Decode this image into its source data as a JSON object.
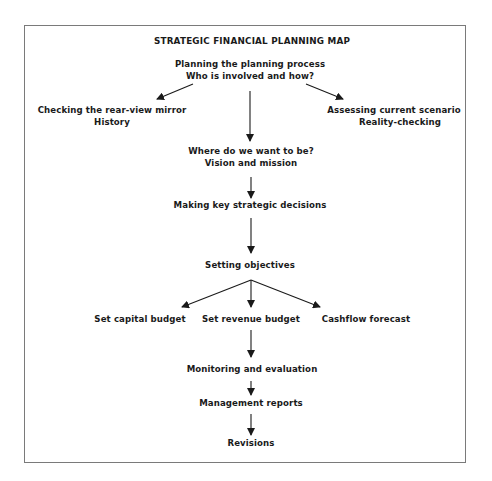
{
  "diagram": {
    "title": "STRATEGIC FINANCIAL PLANNING MAP",
    "nodes": {
      "planning": {
        "line1": "Planning the planning process",
        "line2": "Who is involved and how?"
      },
      "history": {
        "line1": "Checking the rear-view mirror",
        "line2": "History"
      },
      "scenario": {
        "line1": "Assessing current scenario",
        "line2": "Reality-checking"
      },
      "vision": {
        "line1": "Where do we want to be?",
        "line2": "Vision and mission"
      },
      "decisions": {
        "line1": "Making key strategic decisions"
      },
      "objectives": {
        "line1": "Setting objectives"
      },
      "capital": {
        "line1": "Set capital budget"
      },
      "revenue": {
        "line1": "Set revenue budget"
      },
      "cashflow": {
        "line1": "Cashflow forecast"
      },
      "monitoring": {
        "line1": "Monitoring and evaluation"
      },
      "reports": {
        "line1": "Management reports"
      },
      "revisions": {
        "line1": "Revisions"
      }
    },
    "edges": [
      {
        "from": "planning",
        "to": "history"
      },
      {
        "from": "planning",
        "to": "vision"
      },
      {
        "from": "planning",
        "to": "scenario"
      },
      {
        "from": "vision",
        "to": "decisions"
      },
      {
        "from": "decisions",
        "to": "objectives"
      },
      {
        "from": "objectives",
        "to": "capital"
      },
      {
        "from": "objectives",
        "to": "revenue"
      },
      {
        "from": "objectives",
        "to": "cashflow"
      },
      {
        "from": "revenue",
        "to": "monitoring"
      },
      {
        "from": "monitoring",
        "to": "reports"
      },
      {
        "from": "reports",
        "to": "revisions"
      }
    ]
  }
}
